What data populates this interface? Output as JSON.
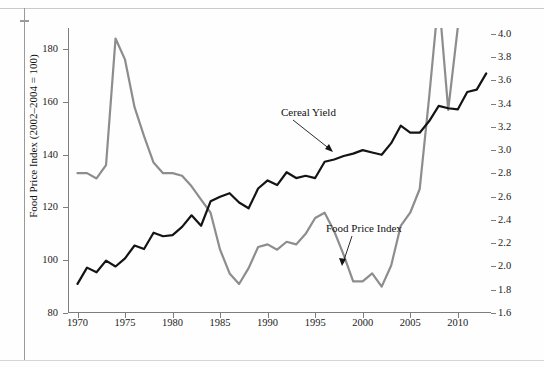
{
  "chart_data": {
    "type": "line",
    "title": "",
    "xlabel": "",
    "ylabel": "Food Price Index (2002–2004 = 100)",
    "y2label": "Cereal Yields (metric tons per hectare)",
    "xlim": [
      1969,
      2013.5
    ],
    "ylim": [
      80,
      188
    ],
    "y2lim": [
      1.6,
      4.05
    ],
    "grid": false,
    "legend_position": "inline-annotations",
    "xticks": [
      1970,
      1975,
      1980,
      1985,
      1990,
      1995,
      2000,
      2005,
      2010
    ],
    "xtick_labels": [
      "1970",
      "1975",
      "1980",
      "1985",
      "1990",
      "1995",
      "2000",
      "2005",
      "2010"
    ],
    "yticks": [
      80,
      100,
      120,
      140,
      160,
      180
    ],
    "ytick_labels": [
      "80",
      "100",
      "120",
      "140",
      "160",
      "180"
    ],
    "y2ticks": [
      1.6,
      1.8,
      2.0,
      2.2,
      2.4,
      2.6,
      2.8,
      3.0,
      3.2,
      3.4,
      3.6,
      3.8,
      4.0
    ],
    "y2tick_labels": [
      "1.6",
      "1.8",
      "2.0",
      "2.2",
      "2.4",
      "2.6",
      "2.8",
      "3.0",
      "3.2",
      "3.4",
      "3.6",
      "3.8",
      "4.0"
    ],
    "x": [
      1970,
      1971,
      1972,
      1973,
      1974,
      1975,
      1976,
      1977,
      1978,
      1979,
      1980,
      1981,
      1982,
      1983,
      1984,
      1985,
      1986,
      1987,
      1988,
      1989,
      1990,
      1991,
      1992,
      1993,
      1994,
      1995,
      1996,
      1997,
      1998,
      1999,
      2000,
      2001,
      2002,
      2003,
      2004,
      2005,
      2006,
      2007,
      2008,
      2009,
      2010,
      2011,
      2012,
      2013
    ],
    "series": [
      {
        "name": "Food Price Index",
        "axis": "left",
        "color": "#8d8d8d",
        "units": "index (2002-2004 = 100)",
        "values": [
          133,
          133,
          131,
          136,
          184,
          176,
          158,
          147,
          137,
          133,
          133,
          132,
          128,
          123,
          118,
          104,
          95,
          91,
          97,
          105,
          106,
          104,
          107,
          106,
          110,
          116,
          118,
          111,
          102,
          92,
          92,
          95,
          90,
          98,
          113,
          118,
          127,
          162,
          200,
          157,
          188,
          230,
          213,
          210
        ]
      },
      {
        "name": "Cereal Yield",
        "axis": "right",
        "color": "#141414",
        "units": "metric tons per hectare",
        "values": [
          1.85,
          1.99,
          1.95,
          2.05,
          2.0,
          2.07,
          2.18,
          2.15,
          2.29,
          2.26,
          2.27,
          2.34,
          2.44,
          2.35,
          2.56,
          2.6,
          2.63,
          2.55,
          2.5,
          2.67,
          2.74,
          2.7,
          2.81,
          2.76,
          2.78,
          2.76,
          2.9,
          2.92,
          2.95,
          2.97,
          3.0,
          2.98,
          2.96,
          3.06,
          3.21,
          3.15,
          3.15,
          3.25,
          3.38,
          3.36,
          3.35,
          3.5,
          3.52,
          3.66
        ]
      }
    ],
    "annotations": [
      {
        "text": "Cereal Yield",
        "series": "Cereal Yield",
        "x": 1990,
        "y": 2.74
      },
      {
        "text": "Food Price Index",
        "series": "Food Price Index",
        "x": 1999.5,
        "y": 92
      }
    ]
  },
  "axes": {
    "left_title": "Food Price Index (2002–2004 = 100)",
    "right_title": "Cereal Yields (metric tons per hectare)"
  }
}
